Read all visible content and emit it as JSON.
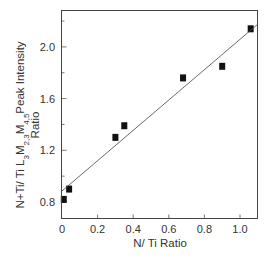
{
  "chart_data": {
    "type": "scatter",
    "title": "",
    "xlabel": "N/ Ti Ratio",
    "ylabel": "N+Ti/ Ti L3M2,3M4,5 Peak Intensity Ratio",
    "ylabel_parts": {
      "line1_prefix": "N+Ti/ Ti L",
      "sub1": "3",
      "m1": "M",
      "sub2": "2,3",
      "m2": "M",
      "sub3": "4,5",
      "line1_suffix": "Peak Intensity",
      "line2": "Ratio"
    },
    "xlim": [
      0,
      1.1
    ],
    "ylim": [
      0.68,
      2.28
    ],
    "xticks": [
      0,
      0.2,
      0.4,
      0.6,
      0.8,
      1.0
    ],
    "xtick_labels": [
      "0",
      "0.2",
      "0.4",
      "0.6",
      "0.8",
      "1.0"
    ],
    "yticks_major": [
      0.8,
      1.2,
      1.6,
      2.0
    ],
    "ytick_labels": [
      "0.8",
      "1.2",
      "1.6",
      "2.0"
    ],
    "yticks_minor": [
      1.0,
      1.4,
      1.8,
      2.2
    ],
    "grid": false,
    "legend": null,
    "series": [
      {
        "name": "Measured",
        "marker": "square",
        "color": "#111111",
        "x": [
          0.01,
          0.04,
          0.3,
          0.35,
          0.68,
          0.9,
          1.06
        ],
        "y": [
          0.82,
          0.9,
          1.3,
          1.39,
          1.76,
          1.85,
          2.14
        ]
      }
    ],
    "fit_line": {
      "name": "Linear fit",
      "color": "#444444",
      "x": [
        0,
        1.095
      ],
      "y": [
        0.885,
        2.17
      ]
    }
  }
}
